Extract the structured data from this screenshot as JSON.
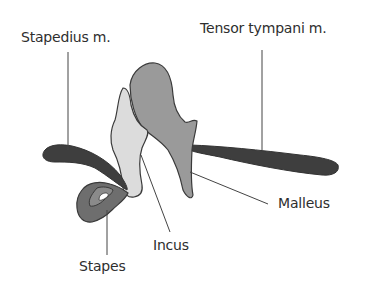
{
  "diagram": {
    "labels": [
      {
        "id": "stapedius",
        "text": "Stapedius m."
      },
      {
        "id": "tensor",
        "text": "Tensor tympani m."
      },
      {
        "id": "malleus",
        "text": "Malleus"
      },
      {
        "id": "incus",
        "text": "Incus"
      },
      {
        "id": "stapes",
        "text": "Stapes"
      }
    ],
    "colors": {
      "muscle": "#3e3e3e",
      "malleus": "#9a9a9a",
      "incus": "#dcdcdc",
      "stapes": "#6e6e6e",
      "outline": "#3a3a3a",
      "leader_line": "#444444",
      "text": "#2e2e2e",
      "background": "#ffffff"
    }
  }
}
